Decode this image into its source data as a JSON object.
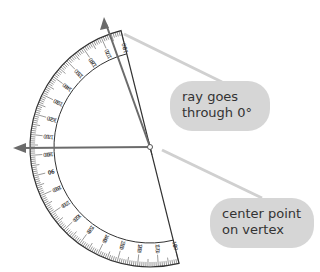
{
  "diagram": {
    "protractor": {
      "center": {
        "x": 150,
        "y": 147
      },
      "outer_radius": 120,
      "inner_scale_radius": 96,
      "orientation_deg": -14,
      "outer_scale_labels": [
        "180",
        "170",
        "160",
        "150",
        "140",
        "130",
        "120",
        "110",
        "100",
        "90",
        "80",
        "70",
        "60",
        "50",
        "40",
        "30",
        "20",
        "10",
        "0"
      ],
      "inner_scale_labels": [
        "0",
        "10",
        "20",
        "30",
        "40",
        "50",
        "60",
        "70",
        "80",
        "90",
        "100",
        "110",
        "120",
        "130",
        "140",
        "150",
        "160",
        "170",
        "180"
      ]
    },
    "rays": [
      {
        "name": "ray-through-zero",
        "from": {
          "x": 150,
          "y": 147
        },
        "to": {
          "x": 104,
          "y": 18
        },
        "color": "#6b6b6b"
      },
      {
        "name": "ray-horizontal",
        "from": {
          "x": 150,
          "y": 147
        },
        "to": {
          "x": 14,
          "y": 148
        },
        "color": "#6b6b6b"
      }
    ],
    "colors": {
      "callout_bg": "#d6d6d6",
      "leader_line": "#d0d0d0",
      "ink": "#333333",
      "ray": "#6b6b6b"
    },
    "callouts": [
      {
        "id": "ray",
        "lines": [
          "ray goes",
          "through 0°"
        ]
      },
      {
        "id": "center",
        "lines": [
          "center point",
          "on vertex"
        ]
      }
    ]
  }
}
